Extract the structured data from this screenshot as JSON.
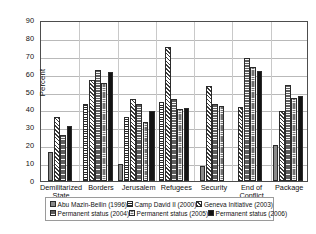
{
  "chart": {
    "ylabel": "Percent",
    "yticks": [
      "0",
      "10",
      "20",
      "30",
      "40",
      "50",
      "60",
      "70",
      "80",
      "90"
    ]
  },
  "legend": {
    "items": [
      {
        "label": "Abu Mazin-Beilin (1996)",
        "pattern": "solid-grey"
      },
      {
        "label": "Camp David II (2000)",
        "pattern": "horizontal-lines"
      },
      {
        "label": "Geneva Initiative (2003)",
        "pattern": "diagonal-hatch"
      },
      {
        "label": "Permanent status (2004)",
        "pattern": "dark-dashed"
      },
      {
        "label": "Permanent status (2005)",
        "pattern": "dark-grid"
      },
      {
        "label": "Permanent status (2006)",
        "pattern": "solid-black"
      }
    ]
  },
  "chart_data": {
    "type": "bar",
    "title": "",
    "xlabel": "",
    "ylabel": "Percent",
    "ylim": [
      0,
      90
    ],
    "ytick_step": 10,
    "grid": true,
    "legend_position": "bottom",
    "categories": [
      "Demilitarized State",
      "Borders",
      "Jerusalem",
      "Refugees",
      "Security",
      "End of Conflict",
      "Package"
    ],
    "series": [
      {
        "name": "Abu Mazin-Beilin (1996)",
        "values": [
          16,
          null,
          9.5,
          null,
          8.5,
          null,
          20
        ]
      },
      {
        "name": "Camp David II (2000)",
        "values": [
          null,
          43,
          36,
          44,
          null,
          null,
          null
        ]
      },
      {
        "name": "Geneva Initiative (2003)",
        "values": [
          36,
          56.5,
          46,
          75,
          53,
          41.5,
          39
        ]
      },
      {
        "name": "Permanent status (2004)",
        "values": [
          26,
          62,
          43,
          46,
          43,
          68.5,
          53.5
        ]
      },
      {
        "name": "Permanent status (2005)",
        "values": [
          null,
          55,
          33,
          40,
          42,
          63.5,
          46.5
        ]
      },
      {
        "name": "Permanent status (2006)",
        "values": [
          31,
          61,
          39,
          41,
          null,
          61.5,
          47.5
        ]
      }
    ]
  }
}
